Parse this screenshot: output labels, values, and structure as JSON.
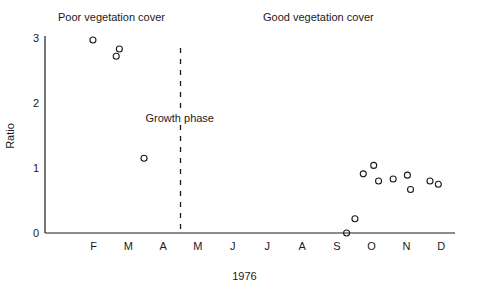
{
  "chart_data": {
    "type": "scatter",
    "title": "",
    "xlabel": "1976",
    "ylabel": "Ratio",
    "categories": [
      "F",
      "M",
      "A",
      "M",
      "J",
      "J",
      "A",
      "S",
      "O",
      "N",
      "D"
    ],
    "xlim": [
      0.6,
      12.4
    ],
    "ylim": [
      0,
      3.1
    ],
    "yticks": [
      0,
      1,
      2,
      3
    ],
    "ytick_labels": [
      "0",
      "1",
      "2",
      "3"
    ],
    "xtick_labels": [
      "F",
      "M",
      "A",
      "M",
      "J",
      "J",
      "A",
      "S",
      "O",
      "N",
      "D"
    ],
    "grid": false,
    "legend": "none",
    "points": [
      {
        "x": 1.98,
        "y": 2.97
      },
      {
        "x": 2.74,
        "y": 2.83
      },
      {
        "x": 2.65,
        "y": 2.72
      },
      {
        "x": 3.45,
        "y": 1.15
      },
      {
        "x": 9.28,
        "y": 0.0
      },
      {
        "x": 9.52,
        "y": 0.22
      },
      {
        "x": 9.76,
        "y": 0.91
      },
      {
        "x": 10.06,
        "y": 1.04
      },
      {
        "x": 10.2,
        "y": 0.8
      },
      {
        "x": 10.62,
        "y": 0.83
      },
      {
        "x": 11.03,
        "y": 0.89
      },
      {
        "x": 11.12,
        "y": 0.67
      },
      {
        "x": 11.68,
        "y": 0.8
      },
      {
        "x": 11.92,
        "y": 0.75
      }
    ],
    "annotations": [
      {
        "id": "poor",
        "text": "Poor vegetation cover"
      },
      {
        "id": "good",
        "text": "Good vegetation cover"
      },
      {
        "id": "growth",
        "text": "Growth phase"
      }
    ],
    "vline": {
      "x": 4.5,
      "label": "Growth phase",
      "style": "dashed"
    }
  },
  "labels": {
    "poor_cover": "Poor vegetation cover",
    "good_cover": "Good vegetation cover",
    "growth_phase": "Growth phase",
    "x_axis": "1976",
    "y_axis": "Ratio"
  }
}
